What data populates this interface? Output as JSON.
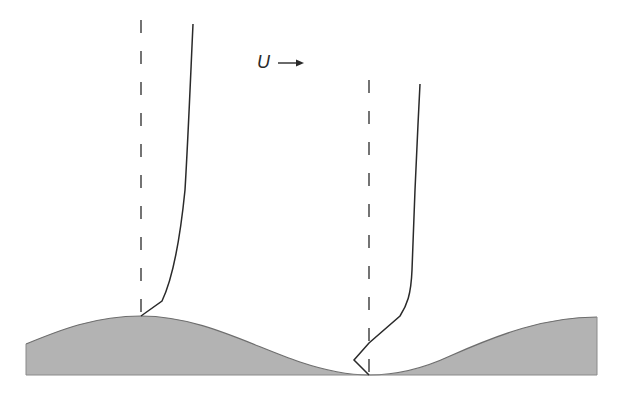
{
  "diagram": {
    "flow_label": "U",
    "flow_direction": "right-arrow",
    "colors": {
      "surface_fill": "#b3b3b3",
      "surface_stroke": "#6e6e6e",
      "line": "#2a2a2a",
      "background": "#ffffff"
    },
    "surface": {
      "shape": "cosine wave",
      "left_x": 26,
      "right_x": 597,
      "base_y": 375,
      "crest_y": 316,
      "trough_y": 375,
      "crest_x": 141,
      "trough_x": 369,
      "wavelength_px": 456
    },
    "profiles": [
      {
        "name": "crest-profile",
        "reference_line": "dashed vertical at crest",
        "reference_x": 141,
        "description": "velocity profile above crest, no reverse flow"
      },
      {
        "name": "trough-profile",
        "reference_line": "dashed vertical at trough",
        "reference_x": 369,
        "description": "velocity profile above trough, showing reversed near-wall flow"
      }
    ]
  }
}
